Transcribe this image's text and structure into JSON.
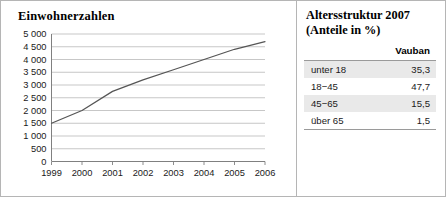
{
  "chart_panel": {
    "title": "Einwohnerzahlen"
  },
  "table_panel": {
    "title_line1": "Altersstruktur 2007",
    "title_line2": "(Anteile in %)",
    "column_header": "Vauban",
    "rows": [
      {
        "label": "unter 18",
        "value": "35,3"
      },
      {
        "label": "18−45",
        "value": "47,7"
      },
      {
        "label": "45−65",
        "value": "15,5"
      },
      {
        "label": "über 65",
        "value": "1,5"
      }
    ]
  },
  "chart_data": {
    "type": "line",
    "title": "Einwohnerzahlen",
    "xlabel": "",
    "ylabel": "",
    "x": [
      1999,
      2000,
      2001,
      2002,
      2003,
      2004,
      2005,
      2006
    ],
    "categories": [
      "1999",
      "2000",
      "2001",
      "2002",
      "2003",
      "2004",
      "2005",
      "2006"
    ],
    "values": [
      1500,
      2000,
      2750,
      3200,
      3600,
      4000,
      4400,
      4700
    ],
    "series": [
      {
        "name": "Einwohnerzahlen",
        "values": [
          1500,
          2000,
          2750,
          3200,
          3600,
          4000,
          4400,
          4700
        ]
      }
    ],
    "ylim": [
      0,
      5000
    ],
    "ytick_step": 500,
    "ytick_labels": [
      "0",
      "500",
      "1 000",
      "1 500",
      "2 000",
      "2 500",
      "3 000",
      "3 500",
      "4 000",
      "4 500",
      "5 000"
    ],
    "ytick_values": [
      0,
      500,
      1000,
      1500,
      2000,
      2500,
      3000,
      3500,
      4000,
      4500,
      5000
    ],
    "xtick_labels": [
      "1999",
      "2000",
      "2001",
      "2002",
      "2003",
      "2004",
      "2005",
      "2006"
    ],
    "grid": "horizontal",
    "legend": "none",
    "line_color": "#555555",
    "grid_color": "#b9b9b9",
    "axis_color": "#808080"
  }
}
